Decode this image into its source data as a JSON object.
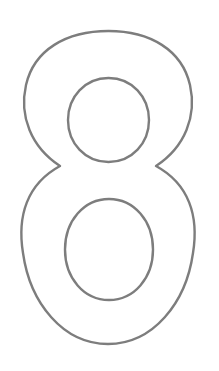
{
  "page": {
    "background_color": "#ffffff",
    "width": 219,
    "height": 371
  },
  "glyph": {
    "character": "8",
    "name": "digit-eight-outline",
    "style": "outline",
    "stroke_color": "#7d7d7d",
    "stroke_width": 2.4,
    "fill_color": "none",
    "bounds": {
      "x": 22,
      "y": 31,
      "width": 171,
      "height": 313
    },
    "outer_contour": {
      "left": 22,
      "right": 193,
      "top": 31,
      "bottom": 344,
      "waist_y": 183,
      "waist_left_x": 62,
      "waist_right_x": 155
    },
    "upper_counter": {
      "name": "upper-counter-hole",
      "left": 68,
      "right": 149,
      "top": 78,
      "bottom": 162,
      "center_x": 108.5,
      "center_y": 120,
      "radius_x": 40.5,
      "radius_y": 42
    },
    "lower_counter": {
      "name": "lower-counter-hole",
      "left": 65,
      "right": 153,
      "top": 199,
      "bottom": 300,
      "center_x": 109,
      "center_y": 249.5,
      "radius_x": 44,
      "radius_y": 50.5
    },
    "path": "M 108.5 31 C 66 31 34 50 26 85 C 19 116 31 147 60 166 C 27 184 17 216 23 253 C 30 303 63 344 108 344 C 153 344 186 303 193 253 C 199 216 189 184 156 166 C 185 147 197 116 190 85 C 182 50 150 31 108.5 31 Z M 108.5 78 C 132 78 149 97 149 120 C 149 143 132 162 108.5 162 C 85 162 68 143 68 120 C 68 97 85 78 108.5 78 Z M 109 199 C 134 199 153 221 153 249.5 C 153 278 134 300 109 300 C 84 300 65 278 65 249.5 C 65 221 84 199 109 199 Z"
  }
}
